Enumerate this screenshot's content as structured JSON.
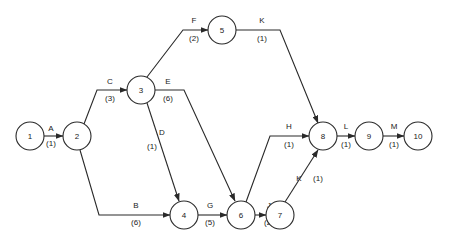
{
  "diagram": {
    "type": "activity-on-arrow network",
    "nodes": [
      {
        "id": "1",
        "x": 30,
        "y": 136
      },
      {
        "id": "2",
        "x": 77,
        "y": 136
      },
      {
        "id": "3",
        "x": 141,
        "y": 90
      },
      {
        "id": "5",
        "x": 222,
        "y": 30
      },
      {
        "id": "4",
        "x": 184,
        "y": 215
      },
      {
        "id": "6",
        "x": 241,
        "y": 215
      },
      {
        "id": "7",
        "x": 280,
        "y": 215
      },
      {
        "id": "8",
        "x": 323,
        "y": 136
      },
      {
        "id": "9",
        "x": 369,
        "y": 136
      },
      {
        "id": "10",
        "x": 418,
        "y": 136
      }
    ],
    "activities": [
      {
        "name": "A",
        "duration": "(1)",
        "from": "1",
        "to": "2",
        "path": "M44,136 L63,136",
        "lx": 51,
        "ly": 131,
        "dx": 51,
        "dy": 146
      },
      {
        "name": "B",
        "duration": "(6)",
        "from": "2",
        "to": "4",
        "path": "M80,150 L99,215 L170,215",
        "lx": 136,
        "ly": 208,
        "dx": 136,
        "dy": 225
      },
      {
        "name": "C",
        "duration": "(3)",
        "from": "2",
        "to": "3",
        "path": "M84,124 L97,90 L127,90",
        "lx": 110,
        "ly": 84,
        "dx": 110,
        "dy": 101
      },
      {
        "name": "D",
        "duration": "(1)",
        "from": "3",
        "to": "4",
        "path": "M147,103 L179,201",
        "lx": 162,
        "ly": 135,
        "dx": 152,
        "dy": 149
      },
      {
        "name": "E",
        "duration": "(6)",
        "from": "3",
        "to": "6",
        "path": "M155,90 L184,90 L235,201",
        "lx": 168,
        "ly": 84,
        "dx": 168,
        "dy": 101
      },
      {
        "name": "F",
        "duration": "(2)",
        "from": "3",
        "to": "5",
        "path": "M147,77 L183,30 L208,30",
        "lx": 194,
        "ly": 23,
        "dx": 194,
        "dy": 41
      },
      {
        "name": "G",
        "duration": "(5)",
        "from": "4",
        "to": "6",
        "path": "M198,215 L227,215",
        "lx": 210,
        "ly": 208,
        "dx": 210,
        "dy": 225
      },
      {
        "name": "H",
        "duration": "(1)",
        "from": "6",
        "to": "8",
        "path": "M246,202 L270,136 L309,136",
        "lx": 289,
        "ly": 129,
        "dx": 289,
        "dy": 147
      },
      {
        "name": "J",
        "duration": "(2)",
        "from": "6",
        "to": "7",
        "path": "M255,215 L266,215",
        "lx": 269,
        "ly": 208,
        "dx": 269,
        "dy": 225
      },
      {
        "name": "K",
        "duration": "(1)",
        "from": "5",
        "to": "8",
        "path": "M236,30 L280,30 L318,123",
        "lx": 262,
        "ly": 23,
        "dx": 262,
        "dy": 41
      },
      {
        "name": "K",
        "duration": "(1)",
        "from": "7",
        "to": "8",
        "path": "M285,202 L318,150",
        "lx": 299,
        "ly": 181,
        "dx": 318,
        "dy": 181
      },
      {
        "name": "L",
        "duration": "(1)",
        "from": "8",
        "to": "9",
        "path": "M337,136 L355,136",
        "lx": 346,
        "ly": 129,
        "dx": 346,
        "dy": 147
      },
      {
        "name": "M",
        "duration": "(1)",
        "from": "9",
        "to": "10",
        "path": "M383,136 L404,136",
        "lx": 394,
        "ly": 129,
        "dx": 394,
        "dy": 147
      }
    ]
  }
}
